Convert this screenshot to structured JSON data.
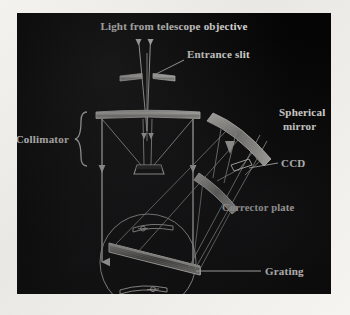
{
  "figure": {
    "panel_background": "#050505",
    "outer_background": "#f1f0ec",
    "line_color": "#e8e7e1",
    "label_color": "#f2f1ec"
  },
  "labels": {
    "light_source": "Light from telescope objective",
    "entrance_slit": "Entrance slit",
    "collimator": "Collimator",
    "spherical_mirror_line1": "Spherical",
    "spherical_mirror_line2": "mirror",
    "ccd": "CCD",
    "corrector_plate": "Corrector plate",
    "grating": "Grating"
  },
  "components": [
    {
      "id": "entrance-slit",
      "label": "Entrance slit",
      "kind": "slit"
    },
    {
      "id": "collimator-lens",
      "label": "Collimator",
      "kind": "lens"
    },
    {
      "id": "fold-mirror",
      "label": "Fold mirror",
      "kind": "mirror"
    },
    {
      "id": "grating",
      "label": "Grating",
      "kind": "diffraction-grating"
    },
    {
      "id": "spherical-mirror",
      "label": "Spherical mirror",
      "kind": "concave-mirror"
    },
    {
      "id": "corrector-plate",
      "label": "Corrector plate",
      "kind": "corrector"
    },
    {
      "id": "ccd",
      "label": "CCD",
      "kind": "detector"
    }
  ]
}
